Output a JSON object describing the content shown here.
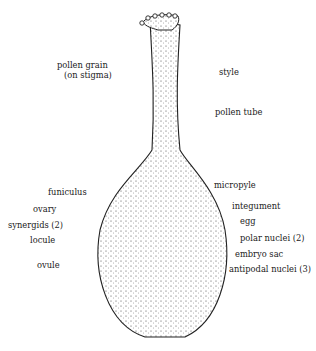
{
  "diagram": {
    "labels_left": [
      {
        "id": "pollen_grain",
        "text": "pollen grain",
        "x": 57,
        "y": 61
      },
      {
        "id": "on_stigma",
        "text": "(on stigma)",
        "x": 64,
        "y": 71
      },
      {
        "id": "funiculus",
        "text": "funiculus",
        "x": 48,
        "y": 190
      },
      {
        "id": "ovary",
        "text": "ovary",
        "x": 33,
        "y": 207
      },
      {
        "id": "synergids",
        "text": "synergids (2)",
        "x": 8,
        "y": 223
      },
      {
        "id": "locule",
        "text": "locule",
        "x": 30,
        "y": 238
      },
      {
        "id": "ovule",
        "text": "ovule",
        "x": 37,
        "y": 263
      }
    ],
    "labels_right": [
      {
        "id": "style",
        "text": "style",
        "x": 219,
        "y": 68
      },
      {
        "id": "pollen_tube",
        "text": "pollen tube",
        "x": 215,
        "y": 108
      },
      {
        "id": "micropyle",
        "text": "micropyle",
        "x": 214,
        "y": 182
      },
      {
        "id": "integument",
        "text": "integument",
        "x": 232,
        "y": 202
      },
      {
        "id": "egg",
        "text": "egg",
        "x": 240,
        "y": 217
      },
      {
        "id": "polar_nuclei",
        "text": "polar nuclei (2)",
        "x": 240,
        "y": 234
      },
      {
        "id": "embryo_sac",
        "text": "embryo sac",
        "x": 235,
        "y": 250
      },
      {
        "id": "antipodal_nuclei",
        "text": "antipodal nuclei (3)",
        "x": 229,
        "y": 265
      }
    ]
  }
}
